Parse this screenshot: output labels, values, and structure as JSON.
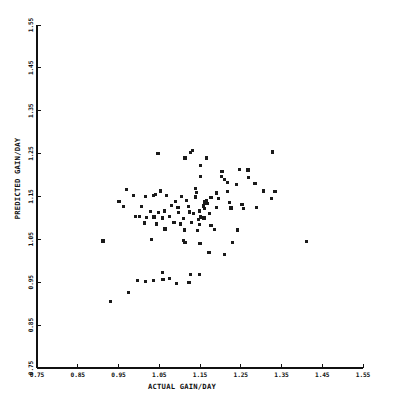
{
  "figure": {
    "background_color": "#ffffff",
    "ink_color": "#111111",
    "marker_color": "#1a1a1a",
    "marker_size_px": 3.2
  },
  "geometry": {
    "x_px_min": 37,
    "x_px_max": 363,
    "y_px_min": 25,
    "y_px_max": 368,
    "tick_len_px": 4
  },
  "chart_data": {
    "type": "scatter",
    "title": "",
    "xlabel": "ACTUAL GAIN/DAY",
    "ylabel": "PREDICTED GAIN/DAY",
    "xlim": [
      0.75,
      1.55
    ],
    "ylim": [
      0.75,
      1.55
    ],
    "xticks": [
      0.75,
      0.85,
      0.95,
      1.05,
      1.15,
      1.25,
      1.35,
      1.45,
      1.55
    ],
    "yticks": [
      0.75,
      0.85,
      0.95,
      1.05,
      1.15,
      1.25,
      1.35,
      1.45,
      1.55
    ],
    "xtick_labels": [
      "0.75",
      "0.85",
      "0.95",
      "1.05",
      "1.15",
      "1.25",
      "1.35",
      "1.45",
      "1.55"
    ],
    "ytick_labels": [
      "0.75",
      "0.85",
      "0.95",
      "1.05",
      "1.15",
      "1.25",
      "1.35",
      "1.45",
      "1.55"
    ],
    "grid": false,
    "legend": null,
    "marker": "square",
    "n_points": 100,
    "points": [
      [
        1.047,
        1.25
      ],
      [
        1.127,
        1.252
      ],
      [
        1.131,
        1.257
      ],
      [
        1.327,
        1.254
      ],
      [
        1.113,
        1.24
      ],
      [
        1.166,
        1.24
      ],
      [
        1.152,
        1.222
      ],
      [
        1.204,
        1.208
      ],
      [
        1.246,
        1.213
      ],
      [
        1.268,
        1.212
      ],
      [
        1.151,
        1.197
      ],
      [
        1.203,
        1.196
      ],
      [
        1.211,
        1.19
      ],
      [
        1.269,
        1.194
      ],
      [
        1.218,
        1.183
      ],
      [
        1.24,
        1.178
      ],
      [
        1.285,
        1.18
      ],
      [
        0.97,
        1.166
      ],
      [
        1.053,
        1.163
      ],
      [
        1.139,
        1.168
      ],
      [
        1.142,
        1.16
      ],
      [
        1.191,
        1.158
      ],
      [
        1.218,
        1.162
      ],
      [
        1.306,
        1.163
      ],
      [
        1.334,
        1.162
      ],
      [
        0.987,
        1.152
      ],
      [
        1.016,
        1.15
      ],
      [
        1.036,
        1.152
      ],
      [
        1.041,
        1.154
      ],
      [
        1.067,
        1.152
      ],
      [
        1.104,
        1.15
      ],
      [
        1.139,
        1.149
      ],
      [
        1.177,
        1.148
      ],
      [
        1.196,
        1.146
      ],
      [
        1.326,
        1.146
      ],
      [
        0.951,
        1.139
      ],
      [
        1.089,
        1.138
      ],
      [
        1.116,
        1.14
      ],
      [
        1.162,
        1.137
      ],
      [
        1.165,
        1.141
      ],
      [
        1.167,
        1.134
      ],
      [
        1.222,
        1.136
      ],
      [
        1.253,
        1.132
      ],
      [
        0.962,
        1.126
      ],
      [
        1.006,
        1.127
      ],
      [
        1.08,
        1.129
      ],
      [
        1.096,
        1.124
      ],
      [
        1.121,
        1.126
      ],
      [
        1.158,
        1.128
      ],
      [
        1.162,
        1.122
      ],
      [
        1.19,
        1.124
      ],
      [
        1.226,
        1.123
      ],
      [
        1.256,
        1.122
      ],
      [
        1.289,
        1.124
      ],
      [
        1.028,
        1.115
      ],
      [
        1.049,
        1.113
      ],
      [
        1.063,
        1.116
      ],
      [
        1.098,
        1.112
      ],
      [
        1.124,
        1.114
      ],
      [
        1.134,
        1.11
      ],
      [
        1.149,
        1.116
      ],
      [
        1.173,
        1.11
      ],
      [
        0.992,
        1.103
      ],
      [
        1.001,
        1.104
      ],
      [
        1.019,
        1.101
      ],
      [
        1.037,
        1.102
      ],
      [
        1.058,
        1.1
      ],
      [
        1.075,
        1.104
      ],
      [
        1.11,
        1.099
      ],
      [
        1.146,
        1.097
      ],
      [
        1.152,
        1.102
      ],
      [
        1.16,
        1.1
      ],
      [
        1.013,
        1.088
      ],
      [
        1.043,
        1.086
      ],
      [
        1.086,
        1.089
      ],
      [
        1.103,
        1.086
      ],
      [
        1.13,
        1.09
      ],
      [
        1.148,
        1.085
      ],
      [
        1.177,
        1.083
      ],
      [
        1.064,
        1.074
      ],
      [
        1.112,
        1.072
      ],
      [
        1.143,
        1.07
      ],
      [
        1.186,
        1.073
      ],
      [
        1.242,
        1.072
      ],
      [
        0.912,
        1.046
      ],
      [
        1.031,
        1.05
      ],
      [
        1.109,
        1.047
      ],
      [
        1.113,
        1.043
      ],
      [
        1.15,
        1.041
      ],
      [
        1.229,
        1.043
      ],
      [
        1.412,
        1.045
      ],
      [
        1.172,
        1.02
      ],
      [
        1.21,
        1.015
      ],
      [
        1.057,
        0.972
      ],
      [
        1.127,
        0.969
      ],
      [
        1.148,
        0.968
      ],
      [
        0.996,
        0.955
      ],
      [
        1.016,
        0.952
      ],
      [
        1.036,
        0.955
      ],
      [
        1.059,
        0.956
      ],
      [
        1.075,
        0.958
      ],
      [
        1.093,
        0.948
      ],
      [
        1.123,
        0.95
      ],
      [
        0.975,
        0.927
      ],
      [
        0.93,
        0.905
      ]
    ]
  }
}
